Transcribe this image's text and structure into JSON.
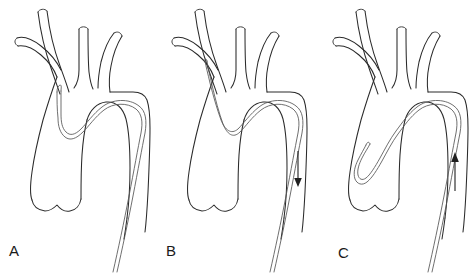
{
  "figure": {
    "background_color": "#ffffff",
    "line_color": "#2b2b2b",
    "catheter_color": "#555555",
    "arrow_color": "#1f1f1f",
    "width": 473,
    "height": 277,
    "caption_fragment": ""
  },
  "panels": [
    {
      "id": "panel-a",
      "label": "A",
      "label_x": 9,
      "label_y": 256,
      "origin_x": 0,
      "catheter_description": "Catheter looped with tip hooked into the innominate artery origin",
      "arrow": null
    },
    {
      "id": "panel-b",
      "label": "B",
      "label_x": 166,
      "label_y": 256,
      "origin_x": 157,
      "catheter_description": "Catheter advanced straight up into the innominate artery",
      "arrow": {
        "direction": "down",
        "x": 298,
        "y_start": 151,
        "y_end": 186
      }
    },
    {
      "id": "panel-c",
      "label": "C",
      "label_x": 338,
      "label_y": 258,
      "origin_x": 318,
      "catheter_description": "Catheter formed into a deep loop within the ascending aorta",
      "arrow": {
        "direction": "up",
        "x": 454,
        "y_start": 191,
        "y_end": 150
      }
    }
  ],
  "anatomy_labels": {
    "ascending_aorta": "ascending aorta",
    "aortic_arch": "aortic arch",
    "descending_aorta": "descending aorta",
    "innominate_artery": "innominate artery",
    "left_common_carotid": "left common carotid artery",
    "left_subclavian": "left subclavian artery",
    "right_subclavian": "right subclavian artery",
    "aortic_root": "aortic root"
  }
}
